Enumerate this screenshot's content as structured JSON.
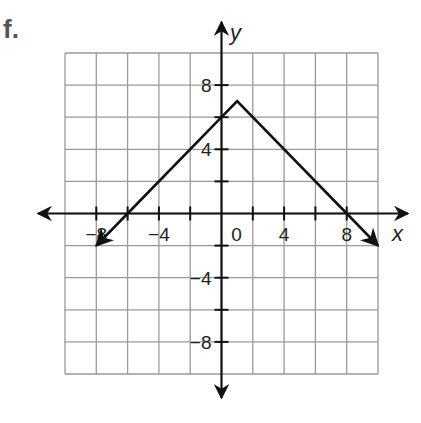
{
  "problem": {
    "label": "f."
  },
  "chart_data": {
    "type": "line",
    "title": "",
    "xlabel": "x",
    "ylabel": "y",
    "xlim": [
      -10,
      10
    ],
    "ylim": [
      -10,
      10
    ],
    "grid": true,
    "grid_step": 2,
    "x_tick_labels": [
      "-8",
      "-4",
      "0",
      "4",
      "8"
    ],
    "y_tick_labels": [
      "8",
      "4",
      "-4",
      "-8"
    ],
    "series": [
      {
        "name": "absolute value function",
        "description": "Inverted V with vertex at (1, 7); y = -|x - 1| + 7",
        "points": [
          [
            -8,
            -2
          ],
          [
            -6,
            0
          ],
          [
            0,
            6
          ],
          [
            1,
            7
          ],
          [
            8,
            0
          ],
          [
            10,
            -2
          ]
        ],
        "vertex": [
          1,
          7
        ],
        "y_intercept": 6,
        "x_intercepts": [
          -6,
          8
        ],
        "arrows_at_ends": true
      }
    ],
    "colors": {
      "line": "#111111",
      "grid": "#9a9a9a",
      "axes": "#111111"
    }
  }
}
